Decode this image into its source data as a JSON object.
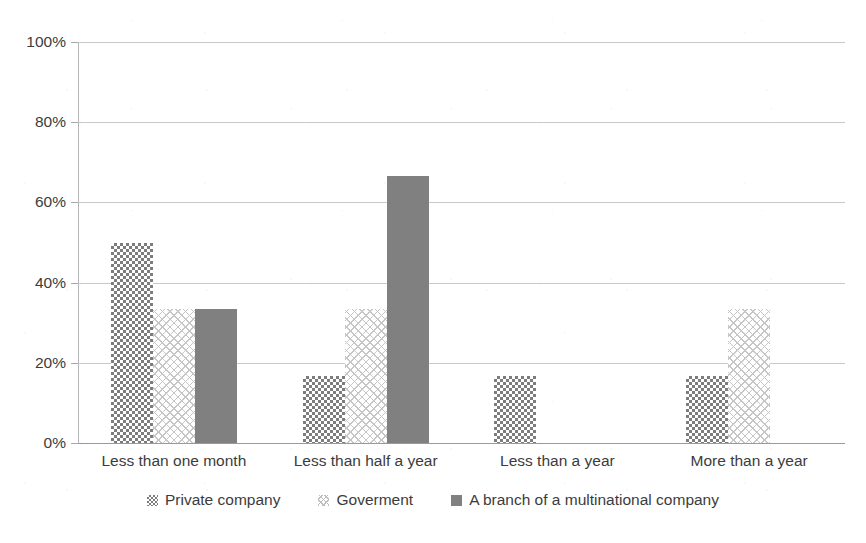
{
  "chart_data": {
    "type": "bar",
    "title": "",
    "subtitle": "",
    "xlabel": "",
    "ylabel": "",
    "ylim": [
      0,
      100
    ],
    "y_ticks": [
      "0%",
      "20%",
      "40%",
      "60%",
      "80%",
      "100%"
    ],
    "y_tick_values": [
      0,
      20,
      40,
      60,
      80,
      100
    ],
    "grid": true,
    "legend_position": "bottom",
    "categories": [
      "Less than one month",
      "Less than half a year",
      "Less than a year",
      "More than a year"
    ],
    "series": [
      {
        "name": "Private company",
        "pattern": "dark-checkerboard",
        "color": "#7d7d7d",
        "values": [
          50.0,
          16.7,
          16.7,
          16.7
        ]
      },
      {
        "name": "Goverment",
        "pattern": "light-crosshatch",
        "color": "#c6c6c6",
        "values": [
          33.3,
          33.3,
          0.0,
          33.3
        ]
      },
      {
        "name": "A branch of a multinational company",
        "pattern": "solid",
        "color": "#808080",
        "values": [
          33.3,
          66.7,
          0.0,
          0.0
        ]
      }
    ]
  },
  "axis": {
    "y_labels": [
      "100%",
      "80%",
      "60%",
      "40%",
      "20%",
      "0%"
    ]
  },
  "legend": {
    "items": [
      {
        "label": "Private company",
        "swatch": "dark-checkerboard-swatch"
      },
      {
        "label": "Goverment",
        "swatch": "light-crosshatch-swatch"
      },
      {
        "label": "A branch of a multinational company",
        "swatch": "solid-gray-swatch"
      }
    ]
  }
}
